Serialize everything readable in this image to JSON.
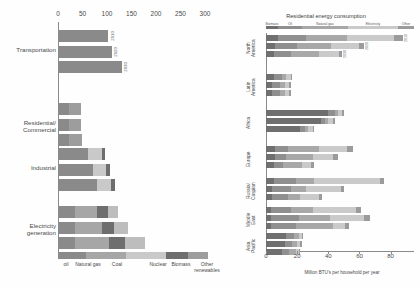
{
  "chart_data": [
    {
      "type": "bar",
      "id": "us-energy-consumption-by-sector",
      "orientation": "horizontal",
      "stacked": true,
      "title": "",
      "xlabel": "",
      "ylabel": "",
      "xlim": [
        0,
        300
      ],
      "xticks": [
        0,
        50,
        100,
        150,
        200,
        250,
        300
      ],
      "grid": false,
      "legend_position": "bottom",
      "categories": [
        "Transportation",
        "Residential/ Commercial",
        "Industrial",
        "Electricity generation"
      ],
      "group_labels": [
        "2010",
        "2020",
        "2030"
      ],
      "series": [
        {
          "name": "oil",
          "color": "#8a8a8a"
        },
        {
          "name": "Natural gas",
          "color": "#a6a6a6"
        },
        {
          "name": "Coal",
          "color": "#c9c9c9"
        },
        {
          "name": "Nuclear",
          "color": "#6e6e6e"
        },
        {
          "name": "Biomass",
          "color": "#9d9d9d"
        },
        {
          "name": "Other renewables",
          "color": "#bdbdbd"
        }
      ],
      "bars": [
        {
          "category": "Transportation",
          "year": "2010",
          "values": [
            103,
            0,
            0,
            0,
            0,
            0
          ]
        },
        {
          "category": "Transportation",
          "year": "2020",
          "values": [
            110,
            0,
            0,
            0,
            0,
            0
          ]
        },
        {
          "category": "Transportation",
          "year": "2030",
          "values": [
            130,
            0,
            0,
            0,
            0,
            0
          ]
        },
        {
          "category": "Residential/ Commercial",
          "year": "2010",
          "values": [
            22,
            0,
            0,
            0,
            25,
            0
          ]
        },
        {
          "category": "Residential/ Commercial",
          "year": "2020",
          "values": [
            22,
            0,
            0,
            0,
            25,
            0
          ]
        },
        {
          "category": "Residential/ Commercial",
          "year": "2030",
          "values": [
            22,
            0,
            0,
            0,
            26,
            0
          ]
        },
        {
          "category": "Industrial",
          "year": "2010",
          "values": [
            62,
            0,
            27,
            7,
            0,
            0
          ]
        },
        {
          "category": "Industrial",
          "year": "2020",
          "values": [
            72,
            0,
            27,
            7,
            0,
            0
          ]
        },
        {
          "category": "Industrial",
          "year": "2030",
          "values": [
            80,
            0,
            28,
            8,
            0,
            0
          ]
        },
        {
          "category": "Electricity generation",
          "year": "2010",
          "values": [
            35,
            45,
            0,
            22,
            0,
            20
          ]
        },
        {
          "category": "Electricity generation",
          "year": "2020",
          "values": [
            35,
            55,
            0,
            25,
            0,
            28
          ]
        },
        {
          "category": "Electricity generation",
          "year": "2030",
          "values": [
            35,
            70,
            0,
            32,
            0,
            40
          ]
        }
      ]
    },
    {
      "type": "bar",
      "id": "residential-energy-consumption-by-region",
      "orientation": "horizontal",
      "stacked": true,
      "title": "Residential energy consumption",
      "xlabel": "Million BTU's per household per year",
      "ylabel": "",
      "xlim": [
        0,
        95
      ],
      "xticks": [
        0,
        20,
        40,
        60,
        80
      ],
      "grid": false,
      "legend_position": "top",
      "categories": [
        "North America",
        "Latin America",
        "Africa",
        "Europe",
        "Russia/ Caspian",
        "Middle East",
        "Asia Pacific"
      ],
      "group_labels": [
        "2010",
        "2020",
        "2030"
      ],
      "series": [
        {
          "name": "Biomass",
          "color": "#6f6f6f"
        },
        {
          "name": "Oil",
          "color": "#8f8f8f"
        },
        {
          "name": "Natural gas",
          "color": "#a8a8a8"
        },
        {
          "name": "Electricity",
          "color": "#cacaca"
        },
        {
          "name": "Other",
          "color": "#9b9b9b"
        }
      ],
      "bars": [
        {
          "category": "North America",
          "year": "2010",
          "values": [
            8,
            18,
            26,
            30,
            6
          ]
        },
        {
          "category": "North America",
          "year": "2020",
          "values": [
            6,
            14,
            22,
            18,
            3
          ]
        },
        {
          "category": "North America",
          "year": "2030",
          "values": [
            5,
            11,
            18,
            13,
            2
          ]
        },
        {
          "category": "Latin America",
          "year": "2010",
          "values": [
            5,
            5,
            3,
            3,
            1
          ]
        },
        {
          "category": "Latin America",
          "year": "2020",
          "values": [
            4,
            5,
            3,
            3,
            1
          ]
        },
        {
          "category": "Latin America",
          "year": "2030",
          "values": [
            4,
            5,
            3,
            3,
            1
          ]
        },
        {
          "category": "Africa",
          "year": "2010",
          "values": [
            40,
            4,
            2,
            3,
            1
          ]
        },
        {
          "category": "Africa",
          "year": "2020",
          "values": [
            35,
            3,
            2,
            3,
            1
          ]
        },
        {
          "category": "Africa",
          "year": "2030",
          "values": [
            22,
            3,
            2,
            3,
            1
          ]
        },
        {
          "category": "Europe",
          "year": "2010",
          "values": [
            6,
            8,
            20,
            18,
            4
          ]
        },
        {
          "category": "Europe",
          "year": "2020",
          "values": [
            6,
            7,
            17,
            13,
            3
          ]
        },
        {
          "category": "Europe",
          "year": "2030",
          "values": [
            5,
            6,
            12,
            6,
            2
          ]
        },
        {
          "category": "Russia/ Caspian",
          "year": "2010",
          "values": [
            5,
            14,
            12,
            42,
            3
          ]
        },
        {
          "category": "Russia/ Caspian",
          "year": "2020",
          "values": [
            4,
            12,
            10,
            22,
            2
          ]
        },
        {
          "category": "Russia/ Caspian",
          "year": "2030",
          "values": [
            4,
            10,
            8,
            12,
            2
          ]
        },
        {
          "category": "Middle East",
          "year": "2010",
          "values": [
            3,
            13,
            14,
            28,
            3
          ]
        },
        {
          "category": "Middle East",
          "year": "2020",
          "values": [
            3,
            18,
            20,
            22,
            4
          ]
        },
        {
          "category": "Middle East",
          "year": "2030",
          "values": [
            3,
            16,
            24,
            8,
            2
          ]
        },
        {
          "category": "Asia Pacific",
          "year": "2010",
          "values": [
            13,
            5,
            3,
            2,
            1
          ]
        },
        {
          "category": "Asia Pacific",
          "year": "2020",
          "values": [
            12,
            5,
            3,
            2,
            1
          ]
        },
        {
          "category": "Asia Pacific",
          "year": "2030",
          "values": [
            10,
            5,
            4,
            2,
            1
          ]
        }
      ]
    }
  ]
}
